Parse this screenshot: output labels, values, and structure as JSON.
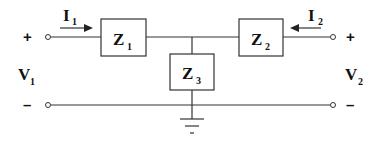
{
  "diagram": {
    "type": "two-port T-network",
    "impedances": [
      {
        "id": "Z1",
        "main": "Z",
        "sub": "1",
        "role": "series-left"
      },
      {
        "id": "Z2",
        "main": "Z",
        "sub": "2",
        "role": "series-right"
      },
      {
        "id": "Z3",
        "main": "Z",
        "sub": "3",
        "role": "shunt"
      }
    ],
    "currents": [
      {
        "id": "I1",
        "main": "I",
        "sub": "1",
        "direction": "right"
      },
      {
        "id": "I2",
        "main": "I",
        "sub": "2",
        "direction": "left"
      }
    ],
    "voltages": [
      {
        "id": "V1",
        "main": "V",
        "sub": "1",
        "port": "left"
      },
      {
        "id": "V2",
        "main": "V",
        "sub": "2",
        "port": "right"
      }
    ],
    "polarity": {
      "plus": "+",
      "minus": "–"
    },
    "ground": "ground-symbol at shunt node"
  }
}
